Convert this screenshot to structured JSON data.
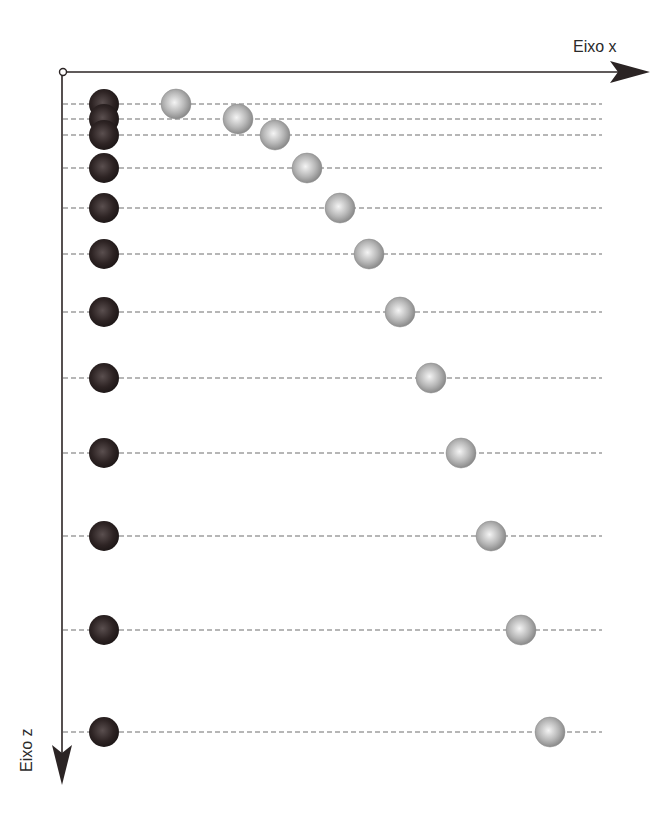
{
  "labels": {
    "x_axis": "Eixo x",
    "z_axis": "Eixo z"
  },
  "colors": {
    "axis": "#2b2424",
    "dashed_line": "#6f6f6f",
    "dark_ball": "#2e2424",
    "light_ball": "#b8b8b8",
    "background": "#ffffff"
  },
  "origin": {
    "x": 63,
    "y": 72
  },
  "axes": {
    "x_end": 650,
    "z_end": 785
  },
  "dashed_line_end_x": 602,
  "dark_ball_x": 104,
  "ball_radius": 15,
  "rows": [
    {
      "z": 104,
      "light_x": 176
    },
    {
      "z": 119,
      "light_x": 238
    },
    {
      "z": 135,
      "light_x": 275
    },
    {
      "z": 168,
      "light_x": 307
    },
    {
      "z": 208,
      "light_x": 340
    },
    {
      "z": 254,
      "light_x": 369
    },
    {
      "z": 312,
      "light_x": 400
    },
    {
      "z": 378,
      "light_x": 431
    },
    {
      "z": 453,
      "light_x": 461
    },
    {
      "z": 536,
      "light_x": 491
    },
    {
      "z": 630,
      "light_x": 521
    },
    {
      "z": 732,
      "light_x": 550
    }
  ]
}
